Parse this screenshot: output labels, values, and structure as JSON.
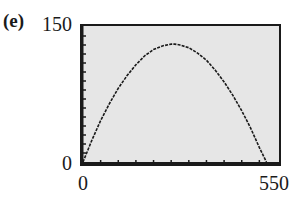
{
  "panel_label": "(e)",
  "chart_data": {
    "type": "line",
    "title": "",
    "xlabel": "",
    "ylabel": "",
    "xlim": [
      0,
      550
    ],
    "ylim": [
      0,
      150
    ],
    "x_tick_labels": [
      "0",
      "550"
    ],
    "y_tick_labels": [
      "0",
      "150"
    ],
    "x_minor_tick_step": 50,
    "y_minor_tick_step": 10,
    "grid": false,
    "legend": null,
    "background": "#e6e6e6",
    "line_color": "#1a1a1a",
    "series": [
      {
        "name": "curve",
        "x": [
          0,
          25,
          50,
          75,
          100,
          125,
          150,
          175,
          200,
          225,
          250,
          260,
          275,
          300,
          325,
          350,
          375,
          400,
          425,
          450,
          475,
          500,
          520
        ],
        "y": [
          0,
          24,
          46,
          65,
          82,
          96,
          108,
          118,
          125,
          129,
          131,
          131,
          130,
          127,
          121,
          113,
          102,
          89,
          74,
          57,
          38,
          16,
          0
        ]
      }
    ]
  },
  "axis_labels": {
    "y_top": "150",
    "y_bottom": "0",
    "x_left": "0",
    "x_right": "550"
  }
}
